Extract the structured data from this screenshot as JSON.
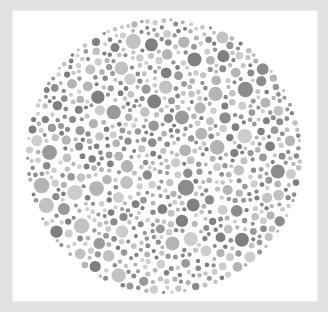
{
  "image": {
    "description": "Grayscale color-vision test plate (Ishihara-style) with a circular field of dots",
    "frame_color": "#e2e2e2",
    "plate_color": "#ffffff"
  },
  "plate": {
    "center": [
      164,
      156
    ],
    "radius": 138,
    "dot_colors": [
      "#7f7f7f",
      "#8c8c8c",
      "#999999",
      "#b4b4b4",
      "#c2c2c2",
      "#cdcdcd"
    ],
    "dot_radius_range": [
      2,
      8
    ],
    "dot_count_target": 1400,
    "seed": 7
  }
}
